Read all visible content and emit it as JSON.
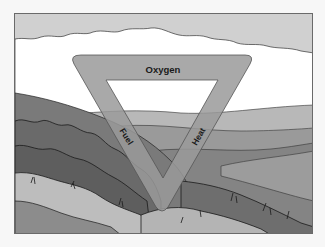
{
  "diagram": {
    "sides": [
      {
        "position": "top",
        "label": "Oxygen"
      },
      {
        "position": "left",
        "label": "Fuel"
      },
      {
        "position": "right",
        "label": "Heat"
      }
    ],
    "background": "grayscale landscape illustration of rolling hills with brush and grass under a cloudy sky"
  },
  "colors": {
    "sky": "#d0d0d0",
    "cloud": "#ffffff",
    "triangle": "#9a9a9a",
    "far_hills": "#b8b8b8",
    "mid_hills": "#8a8a8a",
    "near_brush": "#707070",
    "grass": "#bdbdbd",
    "frame_border": "#6a6a6a"
  }
}
